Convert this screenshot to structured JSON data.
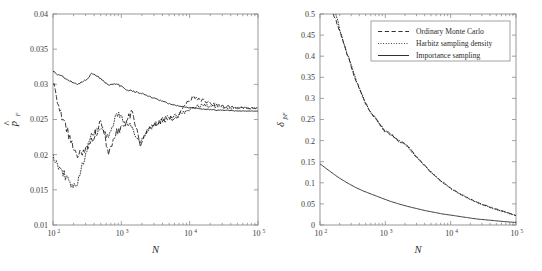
{
  "figure": {
    "background_color": "#ffffff",
    "axis_color": "#8c8c8c",
    "curve_color": "#1a1a1a"
  },
  "chart_data": [
    {
      "id": "left-panel",
      "type": "line",
      "title": "",
      "xlabel": "N",
      "ylabel": "p̂_F",
      "ylabel_base": "p",
      "ylabel_hat": "^",
      "ylabel_sub": "F",
      "xscale": "log",
      "yscale": "linear",
      "xlim": [
        100,
        100000
      ],
      "ylim": [
        0.01,
        0.04
      ],
      "xticks": [
        100,
        1000,
        10000,
        100000
      ],
      "xticklabels": [
        "10",
        "10",
        "10",
        "10"
      ],
      "xtickexponents": [
        "2",
        "3",
        "4",
        "5"
      ],
      "yticks": [
        0.01,
        0.015,
        0.02,
        0.025,
        0.03,
        0.035,
        0.04
      ],
      "yticklabels": [
        "0.01",
        "0.015",
        "0.02",
        "0.025",
        "0.03",
        "0.035",
        "0.04"
      ],
      "grid": false,
      "legend": null,
      "series": [
        {
          "name": "Importance sampling",
          "style": "solid",
          "x": [
            100,
            130,
            170,
            220,
            290,
            380,
            500,
            650,
            850,
            1100,
            1450,
            1900,
            2500,
            3200,
            4200,
            5500,
            7200,
            9500,
            12000,
            16000,
            21000,
            27000,
            36000,
            47000,
            61000,
            80000,
            100000
          ],
          "y": [
            0.0318,
            0.0312,
            0.0305,
            0.03,
            0.0305,
            0.0316,
            0.0308,
            0.0298,
            0.0301,
            0.0294,
            0.029,
            0.0288,
            0.0283,
            0.0279,
            0.0275,
            0.0271,
            0.0269,
            0.0267,
            0.0266,
            0.0265,
            0.0264,
            0.0263,
            0.0263,
            0.0262,
            0.0262,
            0.0262,
            0.0262
          ]
        },
        {
          "name": "Ordinary Monte Carlo",
          "style": "dashed",
          "x": [
            100,
            130,
            170,
            220,
            290,
            380,
            500,
            650,
            850,
            1100,
            1450,
            1900,
            2500,
            3200,
            4200,
            5500,
            7200,
            9500,
            12000,
            16000,
            21000,
            27000,
            36000,
            47000,
            61000,
            80000,
            100000
          ],
          "y": [
            0.03,
            0.026,
            0.0228,
            0.02,
            0.0202,
            0.0223,
            0.0247,
            0.0205,
            0.0232,
            0.0242,
            0.0262,
            0.0212,
            0.0238,
            0.0244,
            0.0249,
            0.0252,
            0.0257,
            0.0278,
            0.0281,
            0.0277,
            0.0272,
            0.027,
            0.0268,
            0.0267,
            0.0266,
            0.0266,
            0.0266
          ]
        },
        {
          "name": "Harbitz sampling density",
          "style": "dotted",
          "x": [
            100,
            130,
            170,
            220,
            290,
            380,
            500,
            650,
            850,
            1100,
            1450,
            1900,
            2500,
            3200,
            4200,
            5500,
            7200,
            9500,
            12000,
            16000,
            21000,
            27000,
            36000,
            47000,
            61000,
            80000,
            100000
          ],
          "y": [
            0.02,
            0.0178,
            0.0163,
            0.0151,
            0.0195,
            0.0231,
            0.0233,
            0.0225,
            0.026,
            0.0247,
            0.0238,
            0.0215,
            0.0237,
            0.0244,
            0.025,
            0.0255,
            0.0257,
            0.0262,
            0.0268,
            0.027,
            0.0269,
            0.0268,
            0.0267,
            0.0266,
            0.0266,
            0.0266,
            0.0266
          ]
        }
      ]
    },
    {
      "id": "right-panel",
      "type": "line",
      "title": "",
      "xlabel": "N",
      "ylabel": "δ_p̂F",
      "ylabel_base": "δ",
      "ylabel_sub": "p̂F",
      "xscale": "log",
      "yscale": "linear",
      "xlim": [
        100,
        100000
      ],
      "ylim": [
        0,
        0.5
      ],
      "xticks": [
        100,
        1000,
        10000,
        100000
      ],
      "xticklabels": [
        "10",
        "10",
        "10",
        "10"
      ],
      "xtickexponents": [
        "2",
        "3",
        "4",
        "5"
      ],
      "yticks": [
        0,
        0.05,
        0.1,
        0.15,
        0.2,
        0.25,
        0.3,
        0.35,
        0.4,
        0.45,
        0.5
      ],
      "yticklabels": [
        "0",
        "0.05",
        "0.1",
        "0.15",
        "0.2",
        "0.25",
        "0.3",
        "0.35",
        "0.4",
        "0.45",
        "0.5"
      ],
      "grid": false,
      "legend": {
        "position": "upper-right",
        "entries": [
          {
            "label": "Ordinary Monte Carlo",
            "style": "dashed"
          },
          {
            "label": "Harbitz sampling density",
            "style": "dotted"
          },
          {
            "label": "Importance sampling",
            "style": "solid"
          }
        ]
      },
      "series": [
        {
          "name": "Ordinary Monte Carlo",
          "style": "dashed",
          "x": [
            160,
            200,
            260,
            330,
            430,
            560,
            730,
            950,
            1250,
            1600,
            2100,
            2750,
            3600,
            4700,
            6100,
            8000,
            10500,
            13500,
            17500,
            23000,
            30000,
            39000,
            51000,
            66000,
            100000
          ],
          "y": [
            0.5,
            0.46,
            0.405,
            0.355,
            0.31,
            0.272,
            0.25,
            0.225,
            0.215,
            0.198,
            0.192,
            0.168,
            0.148,
            0.13,
            0.113,
            0.098,
            0.086,
            0.075,
            0.066,
            0.057,
            0.05,
            0.043,
            0.037,
            0.032,
            0.022
          ]
        },
        {
          "name": "Harbitz sampling density",
          "style": "dotted",
          "x": [
            175,
            210,
            270,
            340,
            440,
            570,
            740,
            960,
            1260,
            1620,
            2120,
            2780,
            3650,
            4750,
            6150,
            8050,
            10550,
            13550,
            17550,
            23050,
            30050,
            39050,
            51050,
            66050,
            100000
          ],
          "y": [
            0.5,
            0.452,
            0.4,
            0.352,
            0.308,
            0.27,
            0.248,
            0.224,
            0.212,
            0.2,
            0.188,
            0.166,
            0.147,
            0.129,
            0.112,
            0.097,
            0.085,
            0.074,
            0.065,
            0.056,
            0.049,
            0.042,
            0.036,
            0.031,
            0.022
          ]
        },
        {
          "name": "Importance sampling",
          "style": "solid",
          "x": [
            100,
            140,
            190,
            260,
            350,
            470,
            640,
            870,
            1200,
            1600,
            2200,
            3000,
            4100,
            5600,
            7600,
            10500,
            14000,
            19000,
            26000,
            36000,
            49000,
            67000,
            100000
          ],
          "y": [
            0.145,
            0.128,
            0.113,
            0.1,
            0.089,
            0.08,
            0.072,
            0.064,
            0.056,
            0.05,
            0.044,
            0.039,
            0.034,
            0.03,
            0.026,
            0.023,
            0.02,
            0.017,
            0.014,
            0.012,
            0.01,
            0.008,
            0.006
          ]
        }
      ]
    }
  ]
}
